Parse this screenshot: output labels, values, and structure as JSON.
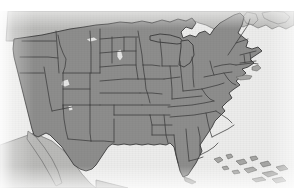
{
  "image": {
    "title": "Map of the contiguous United States",
    "subject": "United States state boundaries",
    "style": "grayscale scanned raster map",
    "width_px": 294,
    "height_px": 194
  },
  "colors": {
    "land_fill": "#8d8d8c",
    "border_line": "#3b3b3b",
    "ocean_background": "#ececeb",
    "neighbor_country_fill": "#b9b9b7",
    "lake_fill": "#e6e6e5",
    "island_fill": "#a7a7a5",
    "page_margin": "#ffffff"
  },
  "layout": {
    "top_margin_height": 11,
    "bottom_margin_height": 6,
    "map_band_top": 11,
    "map_band_height": 177
  },
  "map": {
    "projection_note": "conic, continental US centered",
    "features": {
      "states_shown": 48,
      "great_lakes": true,
      "state_borders": true,
      "labels": false,
      "legend": false,
      "graticule": false
    },
    "regions": [
      {
        "name": "contiguous-united-states",
        "shade": "medium-gray"
      },
      {
        "name": "canada",
        "shade": "light-gray"
      },
      {
        "name": "mexico",
        "shade": "light-gray"
      },
      {
        "name": "baja-california",
        "shade": "light-gray"
      },
      {
        "name": "bahamas-islands",
        "shade": "light-gray"
      },
      {
        "name": "great-lakes",
        "shade": "near-white"
      },
      {
        "name": "atlantic-ocean",
        "shade": "near-white"
      },
      {
        "name": "pacific-ocean",
        "shade": "near-white"
      },
      {
        "name": "gulf-of-mexico",
        "shade": "near-white"
      }
    ],
    "states": [
      "Washington",
      "Oregon",
      "California",
      "Nevada",
      "Idaho",
      "Montana",
      "Wyoming",
      "Utah",
      "Arizona",
      "Colorado",
      "New Mexico",
      "North Dakota",
      "South Dakota",
      "Nebraska",
      "Kansas",
      "Oklahoma",
      "Texas",
      "Minnesota",
      "Iowa",
      "Missouri",
      "Arkansas",
      "Louisiana",
      "Wisconsin",
      "Illinois",
      "Michigan",
      "Indiana",
      "Ohio",
      "Kentucky",
      "Tennessee",
      "Mississippi",
      "Alabama",
      "Georgia",
      "Florida",
      "South Carolina",
      "North Carolina",
      "Virginia",
      "West Virginia",
      "Maryland",
      "Delaware",
      "Pennsylvania",
      "New Jersey",
      "New York",
      "Connecticut",
      "Rhode Island",
      "Massachusetts",
      "Vermont",
      "New Hampshire",
      "Maine"
    ]
  }
}
